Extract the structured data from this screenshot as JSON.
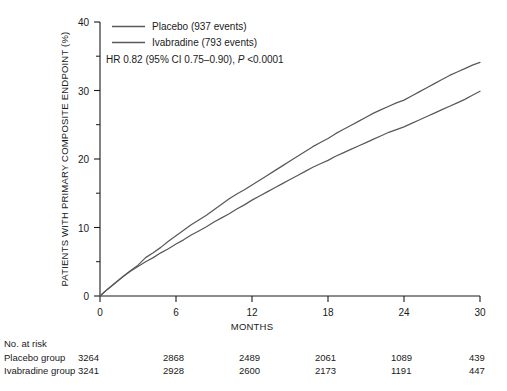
{
  "chart_data": {
    "type": "line",
    "title": "",
    "xlabel": "MONTHS",
    "ylabel": "PATIENTS WITH PRIMARY COMPOSITE ENDPOINT (%)",
    "xlim": [
      0,
      30
    ],
    "ylim": [
      0,
      40
    ],
    "xticks": [
      0,
      6,
      12,
      18,
      24,
      30
    ],
    "xtick_labels": [
      "0",
      "6",
      "12",
      "18",
      "24",
      "30"
    ],
    "yticks": [
      0,
      10,
      20,
      30,
      40
    ],
    "ytick_labels": [
      "0",
      "10",
      "20",
      "30",
      "40"
    ],
    "yticks_minor": [
      5,
      15,
      25,
      35
    ],
    "grid": false,
    "legend_position": "top-left",
    "line_color": "#595959",
    "axis_color": "#1a1a1a",
    "series": [
      {
        "name": "Placebo (937 events)",
        "label": "Placebo",
        "events": 937,
        "x": [
          0,
          0.6,
          1.2,
          1.8,
          2.4,
          3.0,
          3.6,
          4.2,
          4.8,
          5.4,
          6.0,
          6.6,
          7.2,
          7.8,
          8.4,
          9.0,
          9.6,
          10.2,
          10.8,
          11.4,
          12.0,
          12.6,
          13.2,
          13.8,
          14.4,
          15.0,
          15.6,
          16.2,
          16.8,
          17.4,
          18.0,
          18.6,
          19.2,
          19.8,
          20.4,
          21.0,
          21.6,
          22.2,
          22.8,
          23.4,
          24.0,
          24.6,
          25.2,
          25.8,
          26.4,
          27.0,
          27.6,
          28.2,
          28.8,
          29.4,
          30.0
        ],
        "y": [
          0.0,
          1.0,
          1.9,
          2.8,
          3.7,
          4.5,
          5.6,
          6.3,
          7.1,
          8.0,
          8.8,
          9.6,
          10.4,
          11.1,
          11.8,
          12.6,
          13.4,
          14.2,
          14.9,
          15.5,
          16.2,
          16.9,
          17.6,
          18.3,
          19.0,
          19.7,
          20.4,
          21.1,
          21.8,
          22.4,
          23.0,
          23.7,
          24.3,
          24.9,
          25.5,
          26.1,
          26.7,
          27.2,
          27.7,
          28.2,
          28.6,
          29.2,
          29.8,
          30.4,
          31.0,
          31.6,
          32.2,
          32.7,
          33.2,
          33.7,
          34.1
        ]
      },
      {
        "name": "Ivabradine (793 events)",
        "label": "Ivabradine",
        "events": 793,
        "x": [
          0,
          0.6,
          1.2,
          1.8,
          2.4,
          3.0,
          3.6,
          4.2,
          4.8,
          5.4,
          6.0,
          6.6,
          7.2,
          7.8,
          8.4,
          9.0,
          9.6,
          10.2,
          10.8,
          11.4,
          12.0,
          12.6,
          13.2,
          13.8,
          14.4,
          15.0,
          15.6,
          16.2,
          16.8,
          17.4,
          18.0,
          18.6,
          19.2,
          19.8,
          20.4,
          21.0,
          21.6,
          22.2,
          22.8,
          23.4,
          24.0,
          24.6,
          25.2,
          25.8,
          26.4,
          27.0,
          27.6,
          28.2,
          28.8,
          29.4,
          30.0
        ],
        "y": [
          0.0,
          1.0,
          1.9,
          2.8,
          3.6,
          4.3,
          5.0,
          5.6,
          6.3,
          6.9,
          7.6,
          8.2,
          8.9,
          9.5,
          10.1,
          10.8,
          11.4,
          12.0,
          12.7,
          13.3,
          14.0,
          14.6,
          15.2,
          15.8,
          16.4,
          17.0,
          17.6,
          18.2,
          18.8,
          19.3,
          19.8,
          20.4,
          20.9,
          21.4,
          21.9,
          22.4,
          22.9,
          23.4,
          23.9,
          24.3,
          24.7,
          25.2,
          25.7,
          26.2,
          26.7,
          27.2,
          27.7,
          28.2,
          28.7,
          29.3,
          29.9
        ]
      }
    ],
    "annotations": [
      {
        "name": "hazard-ratio",
        "text": "HR 0.82 (95% CI 0.75–0.90), ",
        "text_italic": "P",
        "text_tail": " <0.0001"
      }
    ]
  },
  "legend": {
    "entries": [
      {
        "label": "Placebo (937 events)"
      },
      {
        "label": "Ivabradine (793 events)"
      }
    ]
  },
  "risk_table": {
    "title": "No. at risk",
    "rows": [
      {
        "label": "Placebo group",
        "values": [
          "3264",
          "2868",
          "2489",
          "2061",
          "1089",
          "439"
        ]
      },
      {
        "label": "Ivabradine group",
        "values": [
          "3241",
          "2928",
          "2600",
          "2173",
          "1191",
          "447"
        ]
      }
    ]
  }
}
